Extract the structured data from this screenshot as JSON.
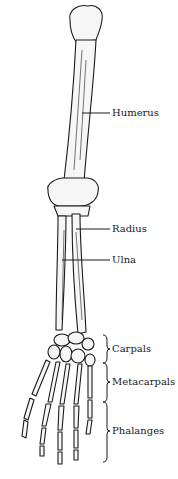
{
  "diagram": {
    "labels": [
      {
        "id": "humerus",
        "text": "Humerus"
      },
      {
        "id": "radius",
        "text": "Radius"
      },
      {
        "id": "ulna",
        "text": "Ulna"
      },
      {
        "id": "carpals",
        "text": "Carpals"
      },
      {
        "id": "metacarpals",
        "text": "Metacarpals"
      },
      {
        "id": "phalanges",
        "text": "Phalanges"
      }
    ],
    "colors": {
      "ink": "#1a1a1a",
      "background": "#ffffff",
      "bone": "#f4f4f4"
    }
  }
}
